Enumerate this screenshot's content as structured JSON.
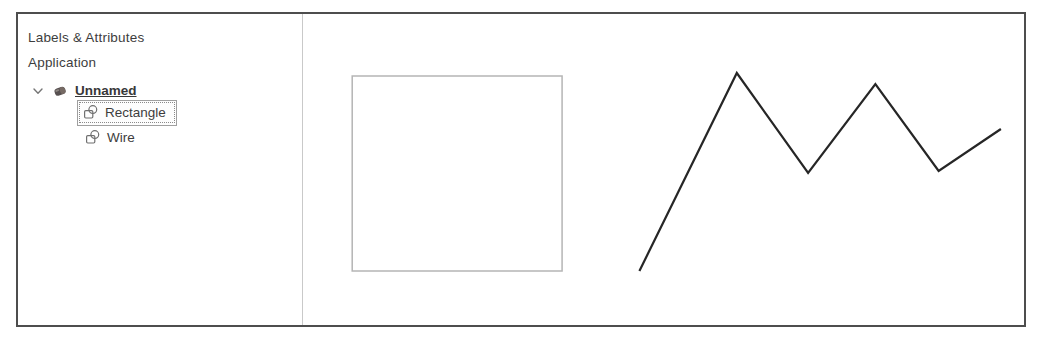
{
  "window": {
    "panel": {
      "title": "Labels & Attributes",
      "subtitle": "Application",
      "tree": {
        "root": {
          "label": "Unnamed",
          "expanded": true,
          "icon": "object-icon"
        },
        "children": [
          {
            "label": "Rectangle",
            "selected": true,
            "icon": "shape-icon"
          },
          {
            "label": "Wire",
            "selected": false,
            "icon": "shape-icon"
          }
        ]
      }
    },
    "canvas": {
      "shapes": [
        {
          "type": "rect",
          "name": "rectangle-shape",
          "x": 49,
          "y": 62,
          "width": 209,
          "height": 195,
          "stroke": "#b5b5b5",
          "strokeWidth": 1.5
        },
        {
          "type": "polyline",
          "name": "wire-shape",
          "points": [
            [
              335,
              257
            ],
            [
              432,
              59
            ],
            [
              503,
              159
            ],
            [
              570,
              70
            ],
            [
              633,
              157
            ],
            [
              695,
              115
            ]
          ],
          "stroke": "#262626",
          "strokeWidth": 2.2
        }
      ]
    }
  },
  "colors": {
    "window_border": "#4d4d4d",
    "divider": "#c9c9c9",
    "text": "#3d3d3d",
    "selection_border": "#9f9f9f",
    "selection_dotted": "#8a8a8a",
    "icon_stroke": "#6f6f6f"
  }
}
